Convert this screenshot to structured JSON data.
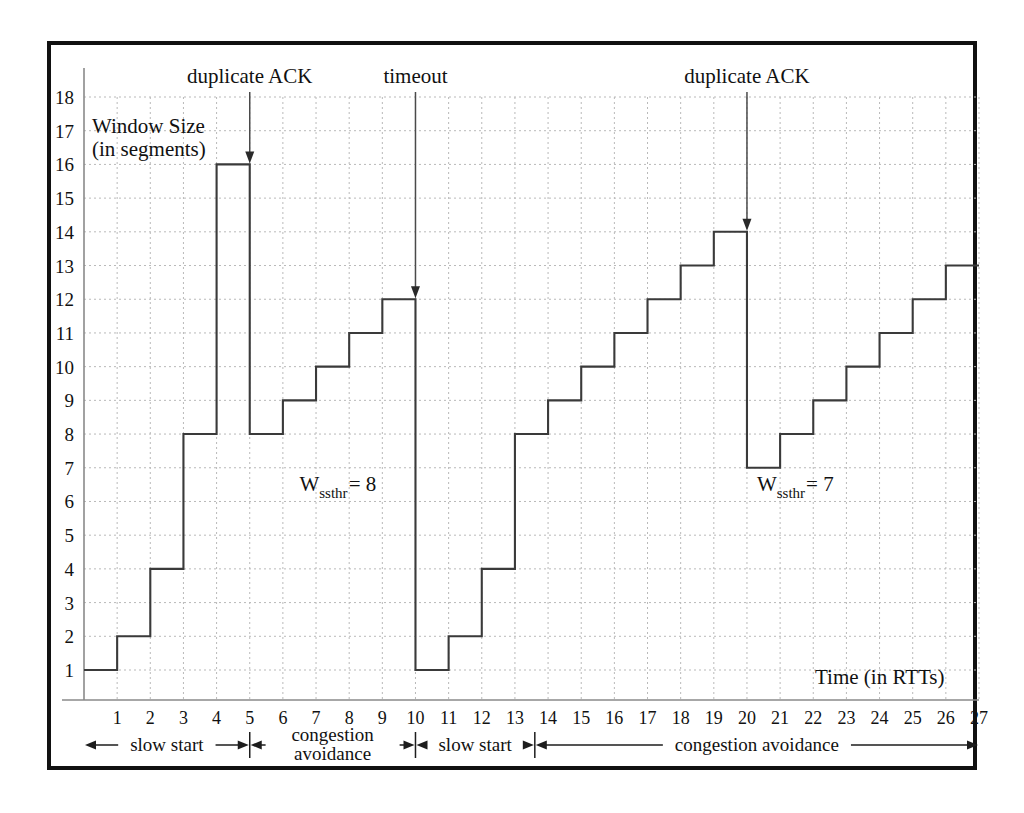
{
  "chart_data": {
    "type": "line",
    "title": "",
    "xlabel": "Time (in RTTs)",
    "ylabel": "Window Size\n(in segments)",
    "ylabel_line1": "Window Size",
    "ylabel_line2": "(in segments)",
    "xlim": [
      0,
      27
    ],
    "ylim": [
      0,
      18
    ],
    "grid": true,
    "legend": "none",
    "x_tick_labels": [
      "1",
      "2",
      "3",
      "4",
      "5",
      "6",
      "7",
      "8",
      "9",
      "10",
      "11",
      "12",
      "13",
      "14",
      "15",
      "16",
      "17",
      "18",
      "19",
      "20",
      "21",
      "22",
      "23",
      "24",
      "25",
      "26",
      "27"
    ],
    "y_tick_labels": [
      "1",
      "2",
      "3",
      "4",
      "5",
      "6",
      "7",
      "8",
      "9",
      "10",
      "11",
      "12",
      "13",
      "14",
      "15",
      "16",
      "17",
      "18"
    ],
    "series": [
      {
        "name": "TCP congestion window",
        "step": "post",
        "x": [
          0,
          1,
          2,
          3,
          4,
          5,
          6,
          7,
          8,
          9,
          10,
          11,
          12,
          13,
          14,
          15,
          16,
          17,
          18,
          19,
          20,
          21,
          22,
          23,
          24,
          25,
          26,
          27
        ],
        "values": [
          1,
          2,
          4,
          8,
          16,
          8,
          9,
          10,
          11,
          12,
          1,
          2,
          4,
          8,
          9,
          10,
          11,
          12,
          13,
          14,
          7,
          8,
          9,
          10,
          11,
          12,
          13,
          13
        ]
      }
    ],
    "annotations": [
      {
        "id": "duplicate-ack-1",
        "label": "duplicate ACK",
        "x": 5,
        "arrow_from_y": 18,
        "arrow_to_y": 16
      },
      {
        "id": "timeout",
        "label": "timeout",
        "x": 10,
        "arrow_from_y": 18,
        "arrow_to_y": 12
      },
      {
        "id": "duplicate-ack-2",
        "label": "duplicate ACK",
        "x": 20,
        "arrow_from_y": 18,
        "arrow_to_y": 14
      }
    ],
    "threshold_labels": [
      {
        "id": "wssthr-1",
        "prefix": "W",
        "subscript": "ssthr",
        "suffix": "= 8",
        "value": 8,
        "x": 6.5,
        "y": 6.3
      },
      {
        "id": "wssthr-2",
        "prefix": "W",
        "subscript": "ssthr",
        "suffix": "= 7",
        "value": 7,
        "x": 20.3,
        "y": 6.3
      }
    ],
    "phases": [
      {
        "id": "phase-slow-start-1",
        "label": "slow start",
        "from": 0,
        "to": 5
      },
      {
        "id": "phase-congestion-avoidance-1",
        "label_line1": "congestion",
        "label_line2": "avoidance",
        "label": "congestion avoidance",
        "from": 5,
        "to": 10
      },
      {
        "id": "phase-slow-start-2",
        "label": "slow start",
        "from": 10,
        "to": 13.6
      },
      {
        "id": "phase-congestion-avoidance-2",
        "label": "congestion avoidance",
        "from": 13.6,
        "to": 27
      }
    ]
  },
  "figure": {
    "caption": ""
  }
}
